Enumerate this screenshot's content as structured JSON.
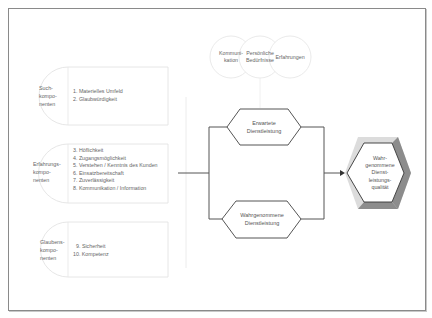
{
  "components": [
    {
      "category": [
        "Such-",
        "kompo-",
        "nenten"
      ],
      "items": [
        "1. Materielles Umfeld",
        "2. Glaubwürdigkeit"
      ]
    },
    {
      "category": [
        "Erfahrungs-",
        "kompo-",
        "nenten"
      ],
      "items": [
        "3. Höflichkeit",
        "4. Zugangsmöglichkeit",
        "5. Verstehen / Kenntnis des Kunden",
        "6. Einsatzbereitschaft",
        "7. Zuverlässigkeit",
        "8. Kommunikation / Information"
      ]
    },
    {
      "category": [
        "Glaubens-",
        "kompo-",
        "nenten"
      ],
      "items": [
        "9. Sicherheit",
        "10. Kompetenz"
      ]
    }
  ],
  "influences": [
    {
      "lines": [
        "Kommuni-",
        "kation"
      ]
    },
    {
      "lines": [
        "Persönliche",
        "Bedürfnisse"
      ]
    },
    {
      "lines": [
        "Erfahrungen"
      ]
    }
  ],
  "expected_service": {
    "lines": [
      "Erwartete",
      "Dienstleistung"
    ]
  },
  "perceived_service": {
    "lines": [
      "Wahrgenommene",
      "Dienstleistung"
    ]
  },
  "result": {
    "lines": [
      "Wahr-",
      "genommene",
      "Dienst-",
      "leistungs-",
      "qualität"
    ]
  },
  "colors": {
    "frame": "#8a8a8a",
    "line": "#555555",
    "faint": "#e2e2e2",
    "hex_dark": "#8c8c8c",
    "hex_light": "#dcdcdc"
  }
}
